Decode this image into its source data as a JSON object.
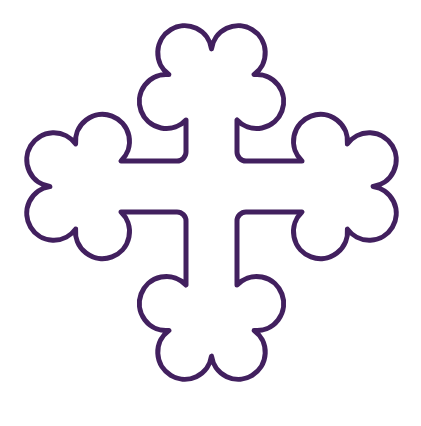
{
  "image": {
    "title": "Cross Botonee",
    "subject": "heraldic cross with trefoil terminals",
    "alt_text": "Purple outline drawing of a Greek cross botonee on a white background",
    "width": 421,
    "height": 426,
    "background_color": "#ffffff"
  },
  "figure": {
    "name": "cross-botonee",
    "stroke_color": "#42205f",
    "fill_color": "#ffffff",
    "stroke_width": 5,
    "symmetry": "four-fold radial",
    "terminal_count": 4,
    "lobes_per_terminal": 3,
    "total_lobes": 12,
    "geometry": {
      "center_x": 211,
      "center_y": 211,
      "arm_width": 51,
      "arm_inner_edge_low": 186,
      "arm_inner_edge_high": 237,
      "lobe_radius": 27,
      "cusp_radius": 9,
      "extent_left": 27,
      "extent_right": 396,
      "extent_top": 22,
      "extent_bottom": 400
    },
    "path": "M 186 152 L 186 120 A 27 27 0 1 1 168.9 74.6 A 27 27 0 1 1 211.5 48.9 A 27 27 0 1 1 254.1 74.6 A 27 27 0 1 1 237 120 L 237 152 A 9 9 0 0 0 246 161 L 270 161 L 302 161 A 27 27 0 1 1 347.4 143.9 A 27 27 0 1 1 373.1 186.5 A 27 27 0 1 1 347.4 229.1 A 27 27 0 1 1 302 212 L 270 212 L 246 212 A 9 9 0 0 0 237 221 L 237 253 L 237 285 A 27 27 0 1 1 254.1 330.4 A 27 27 0 1 1 211.5 356.1 A 27 27 0 1 1 168.9 330.4 A 27 27 0 1 1 186 285 L 186 253 L 186 221 A 9 9 0 0 0 177 212 L 145 212 L 121 212 A 27 27 0 1 1 75.6 229.1 A 27 27 0 1 1 49.9 186.5 A 27 27 0 1 1 75.6 143.9 A 27 27 0 1 1 121 161 L 145 161 L 177 161 A 9 9 0 0 0 186 152 Z"
  }
}
